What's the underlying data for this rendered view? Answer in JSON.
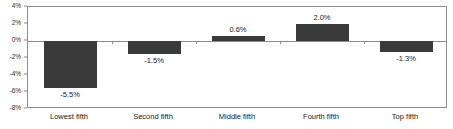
{
  "chart_data": {
    "type": "bar",
    "title": "",
    "subtitle": "",
    "xlabel": "",
    "ylabel": "",
    "categories": [
      "Lowest fifth",
      "Second fifth",
      "Middle fifth",
      "Fourth fifth",
      "Top fifth"
    ],
    "values": [
      -5.5,
      -1.5,
      0.6,
      2.0,
      -1.3
    ],
    "data_labels": [
      "-5.5%",
      "-1.5%",
      "0.6%",
      "2.0%",
      "-1.3%"
    ],
    "ylim": [
      -8,
      4
    ],
    "ytick_values": [
      4,
      2,
      0,
      -2,
      -4,
      -6,
      -8
    ],
    "ytick_labels": [
      "4%",
      "2%",
      "0%",
      "-2%",
      "-4%",
      "-6%",
      "-8%"
    ],
    "grid": false,
    "legend": null,
    "bar_color": "#3a3a3a",
    "axis_color": "#8d8d8d",
    "text_color": "#1c1c1c",
    "background_color": "#ffffff"
  }
}
